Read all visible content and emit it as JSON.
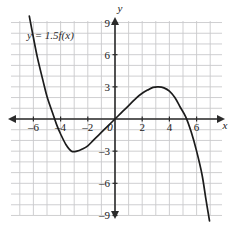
{
  "chart_data": {
    "type": "line",
    "title": "",
    "annotation": "y = 1.5f(x)",
    "xlabel": "x",
    "ylabel": "y",
    "xlim": [
      -7,
      7
    ],
    "ylim": [
      -9.5,
      9.5
    ],
    "grid": true,
    "grid_step": 1,
    "legend": "none",
    "x_ticks": [
      -6,
      -4,
      -2,
      0,
      2,
      4,
      6
    ],
    "x_tick_labels": [
      "–6",
      "–4",
      "–2",
      "0",
      "2",
      "4",
      "6"
    ],
    "y_ticks": [
      9,
      6,
      3,
      -3,
      -6,
      -9
    ],
    "y_tick_labels": [
      "9",
      "6",
      "3",
      "–3",
      "–6",
      "–9"
    ],
    "features": {
      "local_minimum": {
        "x": -3.2,
        "y": -3.0
      },
      "local_maximum": {
        "x": 3.2,
        "y": 3.0
      },
      "x_intercepts": [
        -5.3,
        0,
        5.3
      ],
      "y_intercept": 0
    },
    "points": [
      [
        -6.3,
        9.6
      ],
      [
        -6.0,
        7.6
      ],
      [
        -5.7,
        5.7
      ],
      [
        -5.3,
        3.6
      ],
      [
        -5.0,
        2.1
      ],
      [
        -4.6,
        0.6
      ],
      [
        -4.3,
        -0.5
      ],
      [
        -4.0,
        -1.4
      ],
      [
        -3.6,
        -2.4
      ],
      [
        -3.2,
        -3.0
      ],
      [
        -2.8,
        -3.0
      ],
      [
        -2.4,
        -2.8
      ],
      [
        -2.0,
        -2.5
      ],
      [
        -1.6,
        -2.0
      ],
      [
        -1.2,
        -1.5
      ],
      [
        -0.8,
        -1.0
      ],
      [
        -0.4,
        -0.5
      ],
      [
        0.0,
        0.0
      ],
      [
        0.4,
        0.5
      ],
      [
        0.8,
        1.0
      ],
      [
        1.2,
        1.5
      ],
      [
        1.6,
        2.0
      ],
      [
        2.0,
        2.4
      ],
      [
        2.4,
        2.7
      ],
      [
        2.8,
        2.95
      ],
      [
        3.2,
        3.0
      ],
      [
        3.6,
        2.9
      ],
      [
        4.0,
        2.6
      ],
      [
        4.4,
        2.0
      ],
      [
        4.8,
        1.1
      ],
      [
        5.2,
        0.2
      ],
      [
        5.6,
        -1.2
      ],
      [
        6.0,
        -3.0
      ],
      [
        6.4,
        -5.2
      ],
      [
        6.7,
        -7.6
      ],
      [
        6.95,
        -9.5
      ]
    ]
  },
  "colors": {
    "grid": "#c9c9cc",
    "axis": "#2b2b2b",
    "curve": "#1c1c1c",
    "text": "#1a1a1a",
    "background": "#ffffff"
  }
}
